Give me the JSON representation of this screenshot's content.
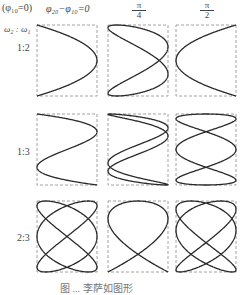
{
  "figure": {
    "header": {
      "phase_ref": "(φ₁₀=0)",
      "col_label_0": "φ₂₀−φ₁₀=0",
      "col_label_1_num": "π",
      "col_label_1_den": "4",
      "col_label_2_num": "π",
      "col_label_2_den": "2",
      "row_axis_label": "ω₂ : ω₁"
    },
    "rows": [
      {
        "label": "1:2"
      },
      {
        "label": "1:3"
      },
      {
        "label": "2:3"
      }
    ],
    "caption": "图 ... 李萨如图形",
    "colors": {
      "curve": "#2a2a2a",
      "box": "#8a8a8a"
    }
  },
  "chart_data": {
    "type": "diagram",
    "columns_phase_difference": [
      "0",
      "π/4",
      "π/2"
    ],
    "rows_frequency_ratio": [
      "1:2",
      "1:3",
      "2:3"
    ],
    "panels": [
      {
        "row": 0,
        "col": 0,
        "a": 1,
        "b": 2,
        "delta": 1.5708
      },
      {
        "row": 0,
        "col": 1,
        "a": 1,
        "b": 2,
        "delta": 0.7854
      },
      {
        "row": 0,
        "col": 2,
        "a": 1,
        "b": 2,
        "delta": -1.5708
      },
      {
        "row": 1,
        "col": 0,
        "a": 1,
        "b": 3,
        "delta": 0.0
      },
      {
        "row": 1,
        "col": 1,
        "a": 1,
        "b": 3,
        "delta": 0.3927
      },
      {
        "row": 1,
        "col": 2,
        "a": 1,
        "b": 3,
        "delta": 1.5708
      },
      {
        "row": 2,
        "col": 0,
        "a": 2,
        "b": 3,
        "delta": 1.5708
      },
      {
        "row": 2,
        "col": 1,
        "a": 2,
        "b": 3,
        "delta": 0.7854
      },
      {
        "row": 2,
        "col": 2,
        "a": 2,
        "b": 3,
        "delta": 0.2618
      }
    ],
    "box_x": [
      37,
      108,
      176
    ],
    "box_y": [
      25,
      114,
      201
    ],
    "box_w": 60,
    "box_h": 71
  }
}
